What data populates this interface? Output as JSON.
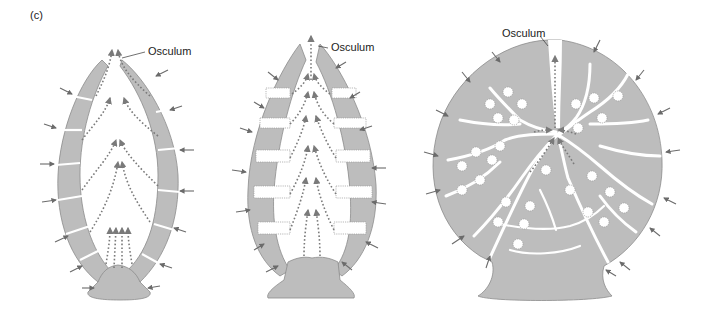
{
  "figure": {
    "panel_label": "(c)",
    "colors": {
      "body_fill": "#bdbdbd",
      "body_stroke": "#8c8c8c",
      "arrow": "#6b6b6b",
      "flow_dots": "#7a7a7a",
      "background": "#ffffff"
    }
  },
  "diagrams": [
    {
      "id": "asconoid",
      "osculum_label": "Osculum"
    },
    {
      "id": "syconoid",
      "osculum_label": "Osculum"
    },
    {
      "id": "leuconoid",
      "osculum_label": "Osculum"
    }
  ]
}
